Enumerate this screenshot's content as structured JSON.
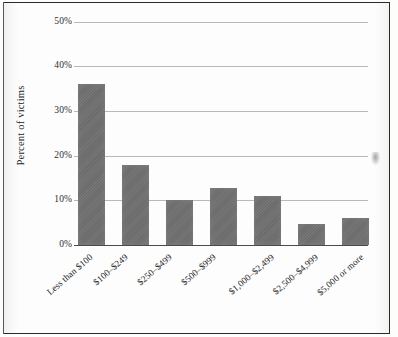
{
  "chart_data": {
    "type": "bar",
    "title": "",
    "xlabel": "",
    "ylabel": "Percent of victims",
    "categories": [
      "Less than $100",
      "$100–$249",
      "$250–$499",
      "$500–$999",
      "$1,000–$2,499",
      "$2,500–$4,999",
      "$5,000 or more"
    ],
    "values": [
      36,
      18,
      10,
      12.7,
      11,
      4.8,
      6
    ],
    "ylim": [
      0,
      50
    ],
    "ytick_labels": [
      "0%",
      "10%",
      "20%",
      "30%",
      "40%",
      "50%"
    ],
    "ytick_values": [
      0,
      10,
      20,
      30,
      40,
      50
    ],
    "grid": true,
    "legend": null,
    "bar_color": "#6f6f6f",
    "grid_color": "#b9b9b9",
    "axis_color": "#4a4a4a",
    "background_color": "#fdfdfd",
    "border_color": "#2b2b2b"
  }
}
